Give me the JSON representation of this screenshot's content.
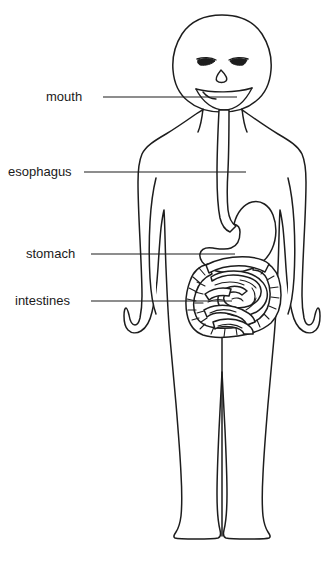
{
  "diagram": {
    "line_color": "#1d1d1d",
    "background_color": "#ffffff",
    "labels": [
      {
        "id": "mouth",
        "text": "mouth",
        "text_x": 46,
        "text_y": 92,
        "line_x1": 103,
        "line_x2": 237,
        "line_y": 97
      },
      {
        "id": "esophagus",
        "text": "esophagus",
        "text_x": 8,
        "text_y": 167,
        "line_x1": 84,
        "line_x2": 246,
        "line_y": 172
      },
      {
        "id": "stomach",
        "text": "stomach",
        "text_x": 26,
        "text_y": 249,
        "line_x1": 91,
        "line_x2": 235,
        "line_y": 254
      },
      {
        "id": "intestines",
        "text": "intestines",
        "text_x": 15,
        "text_y": 296,
        "line_x1": 91,
        "line_x2": 232,
        "line_y": 301
      }
    ],
    "organs": [
      {
        "id": "esophagus-tube",
        "name": "esophagus"
      },
      {
        "id": "stomach-sac",
        "name": "stomach"
      },
      {
        "id": "large-intestine",
        "name": "large intestine"
      },
      {
        "id": "small-intestine",
        "name": "small intestine"
      }
    ],
    "face": {
      "eyes": 2,
      "nose": 1,
      "mouth_expression": "smile"
    }
  }
}
